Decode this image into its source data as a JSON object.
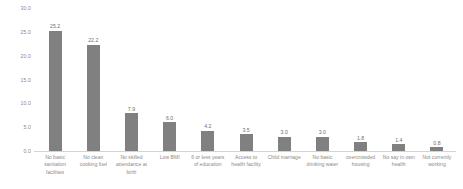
{
  "chart_data": {
    "type": "bar",
    "title": "",
    "subtitle": "",
    "xlabel": "",
    "ylabel": "",
    "ylim": [
      0.0,
      30.0
    ],
    "grid": false,
    "legend": null,
    "yticks": [
      "0.0",
      "5.0",
      "10.0",
      "15.0",
      "20.0",
      "25.0",
      "30.0"
    ],
    "ytick_values": [
      0.0,
      5.0,
      10.0,
      15.0,
      20.0,
      25.0,
      30.0
    ],
    "categories": [
      "No basic sanitation facilities",
      "No clean cooking fuel",
      "No skilled attendance at birth",
      "Low BMI",
      "6 or less years of education",
      "Access to health facility",
      "Child marriage",
      "No basic drinking water",
      "overcrowded housing",
      "No say in own health",
      "Not currently working"
    ],
    "values": [
      25.2,
      22.2,
      7.9,
      6.0,
      4.2,
      3.5,
      3.0,
      3.0,
      1.8,
      1.4,
      0.8
    ],
    "value_labels": [
      "25.2",
      "22.2",
      "7.9",
      "6.0",
      "4.2",
      "3.5",
      "3.0",
      "3.0",
      "1.8",
      "1.4",
      "0.8"
    ],
    "bar_color": "#808080",
    "axis_color": "#d4d4d4",
    "label_color": "#8a8a8a"
  }
}
